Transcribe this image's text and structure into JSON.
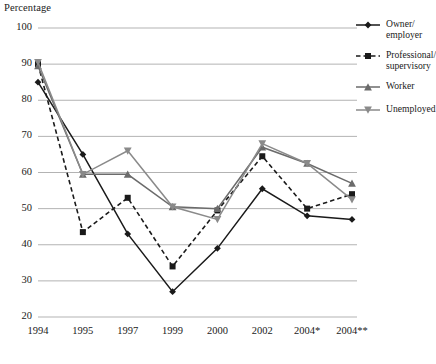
{
  "chart_data": {
    "type": "line",
    "title": "",
    "xlabel": "",
    "ylabel": "Percentage",
    "categories": [
      "1994",
      "1995",
      "1997",
      "1999",
      "2000",
      "2002",
      "2004*",
      "2004**"
    ],
    "ylim": [
      20,
      100
    ],
    "ytick_values": [
      20,
      30,
      40,
      50,
      60,
      70,
      80,
      90,
      100
    ],
    "grid": "horizontal",
    "legend_position": "right",
    "series": [
      {
        "name": "Owner/ employer",
        "values": [
          85,
          65,
          43,
          27,
          39,
          55.5,
          48,
          47
        ],
        "color": "#1a1a1a",
        "dash": "solid",
        "marker": "diamond"
      },
      {
        "name": "Professional/ supervisory",
        "values": [
          90,
          43.5,
          53,
          34,
          49.5,
          64.5,
          50,
          54
        ],
        "color": "#1a1a1a",
        "dash": "dashed",
        "marker": "square"
      },
      {
        "name": "Worker",
        "values": [
          89.5,
          59.5,
          59.5,
          50.5,
          50,
          67,
          62.5,
          57
        ],
        "color": "#6b6b6b",
        "dash": "solid",
        "marker": "triangle-up"
      },
      {
        "name": "Unemployed",
        "values": [
          90.5,
          59.5,
          66,
          50.5,
          47,
          68,
          62.5,
          52.5
        ],
        "color": "#8a8a8a",
        "dash": "solid",
        "marker": "triangle-down"
      }
    ]
  },
  "legend": {
    "items": [
      {
        "label_line1": "Owner/",
        "label_line2": "employer"
      },
      {
        "label_line1": "Professional/",
        "label_line2": "supervisory"
      },
      {
        "label_line1": "Worker",
        "label_line2": ""
      },
      {
        "label_line1": "Unemployed",
        "label_line2": ""
      }
    ]
  }
}
